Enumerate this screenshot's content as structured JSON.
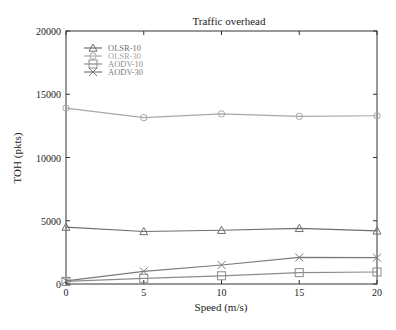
{
  "chart_data": {
    "type": "line",
    "title": "Traffic overhead",
    "xlabel": "Speed (m/s)",
    "ylabel": "TOH (pkts)",
    "x": [
      0,
      5,
      10,
      15,
      20
    ],
    "xlim": [
      0,
      20
    ],
    "ylim": [
      0,
      20000
    ],
    "xticks": [
      0,
      5,
      10,
      15,
      20
    ],
    "yticks": [
      0,
      5000,
      10000,
      15000,
      20000
    ],
    "grid": false,
    "legend_position": "upper-left",
    "series": [
      {
        "name": "OLSR-10",
        "marker": "triangle",
        "color": "#6e6e6e",
        "values": [
          4500,
          4150,
          4250,
          4400,
          4200
        ]
      },
      {
        "name": "OLSR-30",
        "marker": "diamond",
        "color": "#a8a8a8",
        "values": [
          13900,
          13150,
          13450,
          13250,
          13300
        ]
      },
      {
        "name": "AODV-10",
        "marker": "square",
        "color": "#8c8c8c",
        "values": [
          200,
          450,
          650,
          900,
          950
        ]
      },
      {
        "name": "AODV-30",
        "marker": "x",
        "color": "#7a7a7a",
        "values": [
          250,
          1000,
          1500,
          2100,
          2080
        ]
      }
    ]
  }
}
